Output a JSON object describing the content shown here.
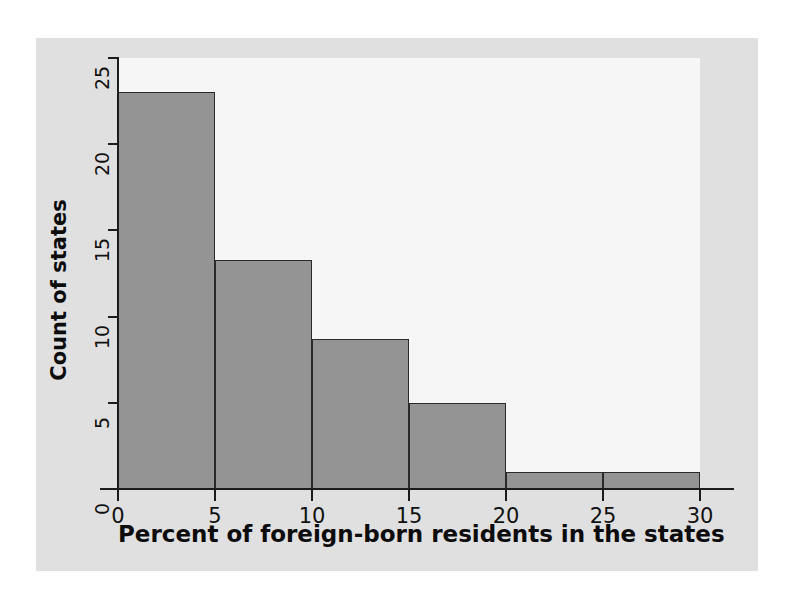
{
  "chart_data": {
    "type": "bar",
    "title": "",
    "subtitle": "",
    "xlabel": "Percent of foreign-born residents in the states",
    "ylabel": "Count of states",
    "xlim": [
      0,
      30
    ],
    "ylim": [
      0,
      25
    ],
    "xticks": [
      0,
      5,
      10,
      15,
      20,
      25,
      30
    ],
    "yticks": [
      0,
      5,
      10,
      15,
      20,
      25
    ],
    "xtick_labels": [
      "0",
      "5",
      "10",
      "15",
      "20",
      "25",
      "30"
    ],
    "ytick_labels": [
      "0",
      "5",
      "10",
      "15",
      "20",
      "25"
    ],
    "grid": false,
    "legend": null,
    "bin_width": 5,
    "bin_edges": [
      0,
      5,
      10,
      15,
      20,
      25,
      30
    ],
    "categories": [
      "0-5",
      "5-10",
      "10-15",
      "15-20",
      "20-25",
      "25-30"
    ],
    "values": [
      23,
      13.3,
      8.7,
      5,
      1,
      1
    ],
    "bars": [
      {
        "label": "0-5",
        "x0": 0,
        "x1": 5,
        "value": 23
      },
      {
        "label": "5-10",
        "x0": 5,
        "x1": 10,
        "value": 13.3
      },
      {
        "label": "10-15",
        "x0": 10,
        "x1": 15,
        "value": 8.7
      },
      {
        "label": "15-20",
        "x0": 15,
        "x1": 20,
        "value": 5
      },
      {
        "label": "20-25",
        "x0": 20,
        "x1": 25,
        "value": 1
      },
      {
        "label": "25-30",
        "x0": 25,
        "x1": 30,
        "value": 1
      }
    ],
    "colors": {
      "bar_fill": "#949494",
      "bar_edge": "#2a2a2a",
      "axis": "#1c1c1c",
      "plot_background": "#f6f6f6",
      "figure_background": "#e0e0e0",
      "page_background": "#ffffff",
      "text": "#0c0c0c"
    }
  }
}
